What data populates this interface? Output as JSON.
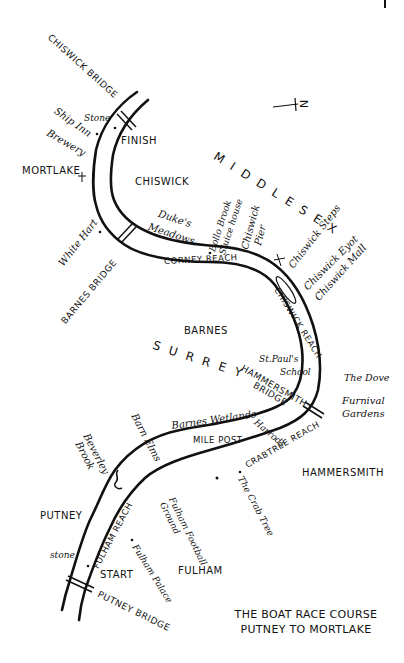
{
  "title": {
    "line1": "THE BOAT RACE COURSE",
    "line2": "PUTNEY TO MORTLAKE"
  },
  "compass": {
    "label": "N",
    "symbol": "+"
  },
  "regions": {
    "middlesex": "MIDDLESEX",
    "surrey": "SURREY"
  },
  "districts": {
    "chiswick": "CHISWICK",
    "mortlake": "MORTLAKE",
    "barnes": "BARNES",
    "hammersmith": "HAMMERSMITH",
    "putney": "PUTNEY",
    "fulham": "FULHAM"
  },
  "bridges": {
    "chiswick": "CHISWICK BRIDGE",
    "barnes": "BARNES BRIDGE",
    "hammersmith": "HAMMERSMITH BRIDGE",
    "putney": "PUTNEY BRIDGE"
  },
  "reaches": {
    "corney": "CORNEY REACH",
    "chiswick": "CHISWICK REACH",
    "crabtree": "CRABTREE REACH",
    "fulham": "FULHAM REACH"
  },
  "course": {
    "start": "START",
    "finish": "FINISH",
    "mile_post": "MILE POST",
    "stone_finish": "Stone",
    "stone_start": "stone"
  },
  "landmarks": {
    "ship_inn": "Ship Inn",
    "brewery": "Brewery",
    "white_hart": "White Hart",
    "dukes_meadows_1": "Duke's",
    "dukes_meadows_2": "Meadows",
    "bollo_brook": "Bollo Brook",
    "sluice_house": "Sluice house",
    "chiswick_pier_1": "Chiswick",
    "chiswick_pier_2": "Pier",
    "chiswick_steps": "Chiswick Steps",
    "chiswick_eyot": "Chiswick Eyot",
    "chiswick_mall": "Chiswick Mall",
    "st_pauls_1": "St.Paul's",
    "st_pauls_2": "School",
    "the_dove": "The Dove",
    "furnival_1": "Furnival",
    "furnival_2": "Gardens",
    "harrods": "Harrods",
    "barnes_wetlands": "Barnes Wetlands",
    "barn_elms": "Barn Elms",
    "beverley_brook_1": "Beverley",
    "beverley_brook_2": "Brook",
    "the_crab_tree": "The Crab Tree",
    "fulham_football_1": "Fulham Football",
    "fulham_football_2": "Ground",
    "fulham_palace": "Fulham Palace"
  }
}
